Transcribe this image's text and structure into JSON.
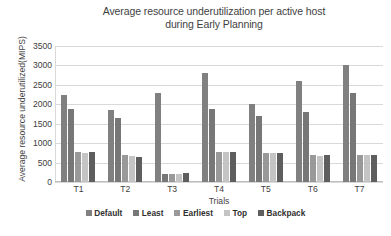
{
  "chart_data": {
    "type": "bar",
    "title": "Average resource underutilization per active host during Early Planning",
    "title_line1": "Average resource underutilization per active host",
    "title_line2": "during Early Planning",
    "xlabel": "Trials",
    "ylabel": "Average resource underutilized(MIPS)",
    "categories": [
      "T1",
      "T2",
      "T3",
      "T4",
      "T5",
      "T6",
      "T7"
    ],
    "ylim": [
      0,
      3500
    ],
    "yticks": [
      3500,
      3000,
      2500,
      2000,
      1500,
      1000,
      500,
      0
    ],
    "grid": true,
    "legend_position": "bottom",
    "series": [
      {
        "name": "Default",
        "color": "#808080",
        "values": [
          2230,
          1850,
          2300,
          2800,
          2000,
          2600,
          3000
        ]
      },
      {
        "name": "Least",
        "color": "#777777",
        "values": [
          1870,
          1650,
          200,
          1870,
          1700,
          1800,
          2300
        ]
      },
      {
        "name": "Earliest",
        "color": "#999999",
        "values": [
          760,
          700,
          200,
          780,
          750,
          700,
          700
        ]
      },
      {
        "name": "Top",
        "color": "#c4c4c4",
        "values": [
          740,
          660,
          210,
          760,
          740,
          680,
          690
        ]
      },
      {
        "name": "Backpack",
        "color": "#5e5e5e",
        "values": [
          760,
          650,
          240,
          760,
          750,
          700,
          700
        ]
      }
    ]
  },
  "colors": {
    "gridline": "#d9d9d9",
    "axis": "#bfbfbf",
    "text": "#3f3f3f",
    "background": "#ffffff"
  }
}
